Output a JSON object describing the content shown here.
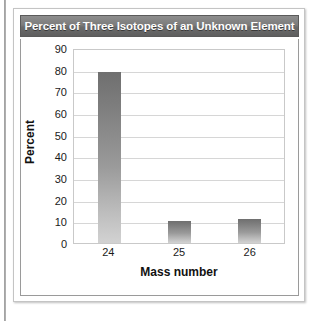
{
  "figure": {
    "title": "Percent of Three Isotopes of an Unknown Element"
  },
  "chart_data": {
    "type": "bar",
    "title": "Percent of Three Isotopes of an Unknown Element",
    "categories": [
      "24",
      "25",
      "26"
    ],
    "values": [
      79,
      10,
      11
    ],
    "xlabel": "Mass number",
    "ylabel": "Percent",
    "ylim": [
      0,
      90
    ],
    "ytick_step": 10,
    "yticks": [
      "90",
      "80",
      "70",
      "60",
      "50",
      "40",
      "30",
      "20",
      "10",
      "0"
    ],
    "grid": true,
    "legend": false,
    "bar_color": "#8f8f8f",
    "title_bar_color": "#6f6f6f",
    "title_text_color": "#ffffff"
  }
}
